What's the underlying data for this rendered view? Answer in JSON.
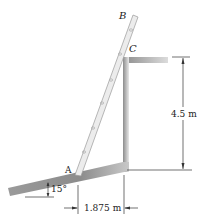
{
  "figure": {
    "type": "statics-ladder-diagram",
    "points": {
      "A": "A",
      "B": "B",
      "C": "C"
    },
    "dimensions": {
      "height": "4.5 m",
      "horizontal": "1.875 m",
      "slope_angle": "15°"
    },
    "colors": {
      "surface_dark": "#8a8a8a",
      "surface_light": "#e6e6e6",
      "ladder_fill": "#e9e9e9",
      "ladder_edge": "#9a9a9a",
      "line": "#333333"
    }
  }
}
